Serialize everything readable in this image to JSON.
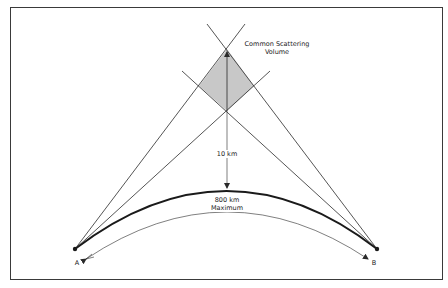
{
  "figure": {
    "labels": {
      "scattering_volume": "Common Scattering Volume",
      "scattering_volume_line1": "Common Scattering",
      "scattering_volume_line2": "Volume",
      "height": "10 km",
      "distance_line1": "800 km",
      "distance_line2": "Maximum",
      "station_a": "A",
      "station_b": "B"
    },
    "colors": {
      "line": "#2a2a2a",
      "volume_fill": "#c8c8c8",
      "frame": "#3a3a3a",
      "background": "#ffffff"
    },
    "geometry": {
      "station_a": [
        75,
        249
      ],
      "station_b": [
        377,
        249
      ],
      "volume_top": [
        227,
        49
      ],
      "volume_bottom": [
        227,
        111
      ],
      "volume_left": [
        199,
        86
      ],
      "volume_right": [
        254,
        86
      ],
      "earth_arc_apex": [
        227,
        190
      ]
    }
  }
}
